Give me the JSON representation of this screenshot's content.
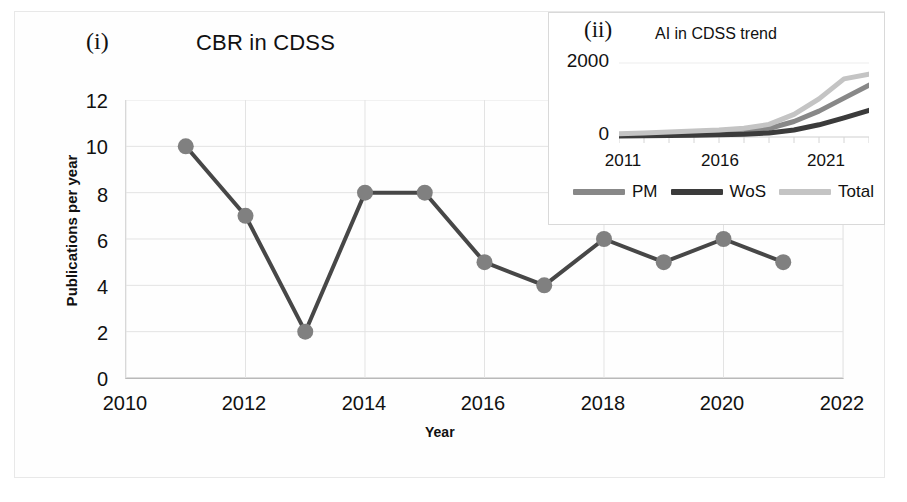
{
  "figure": {
    "panel_tag": "(i)",
    "title": "CBR in CDSS"
  },
  "axes": {
    "y_title": "Publications per year",
    "x_title": "Year",
    "y_ticks": [
      "0",
      "2",
      "4",
      "6",
      "8",
      "10",
      "12"
    ],
    "x_ticks": [
      "2010",
      "2012",
      "2014",
      "2016",
      "2018",
      "2020",
      "2022"
    ]
  },
  "inset": {
    "panel_tag": "(ii)",
    "title": "AI in CDSS trend",
    "y_ticks": [
      "2000",
      "0"
    ],
    "x_ticks": [
      "2011",
      "2016",
      "2021"
    ],
    "legend": [
      {
        "label": "PM",
        "color": "#888888"
      },
      {
        "label": "WoS",
        "color": "#3b3b3b"
      },
      {
        "label": "Total",
        "color": "#c4c4c4"
      }
    ]
  },
  "colors": {
    "line": "#474747",
    "marker": "#808080",
    "grid": "#e3e3e3",
    "axis": "#b9b9b9",
    "pm": "#888888",
    "wos": "#3b3b3b",
    "total": "#c4c4c4"
  },
  "chart_data": {
    "type": "line",
    "title": "CBR in CDSS",
    "xlabel": "Year",
    "ylabel": "Publications per year",
    "xlim": [
      2010,
      2022
    ],
    "ylim": [
      0,
      12
    ],
    "grid": true,
    "legend_position": "none",
    "x": [
      2011,
      2012,
      2013,
      2014,
      2015,
      2016,
      2017,
      2018,
      2019,
      2020,
      2021
    ],
    "values": [
      10,
      7,
      2,
      8,
      8,
      5,
      4,
      6,
      5,
      6,
      5
    ],
    "series": [
      {
        "name": "Publications per year",
        "values": [
          10,
          7,
          2,
          8,
          8,
          5,
          4,
          6,
          5,
          6,
          5
        ]
      }
    ],
    "inset": {
      "type": "line",
      "title": "AI in CDSS trend",
      "xlabel": "",
      "ylabel": "",
      "xlim": [
        2011,
        2021
      ],
      "ylim": [
        0,
        2000
      ],
      "grid": false,
      "legend_position": "bottom",
      "x": [
        2011,
        2012,
        2013,
        2014,
        2015,
        2016,
        2017,
        2018,
        2019,
        2020,
        2021
      ],
      "series": [
        {
          "name": "PM",
          "values": [
            60,
            75,
            90,
            110,
            130,
            160,
            230,
            420,
            700,
            1050,
            1400
          ]
        },
        {
          "name": "WoS",
          "values": [
            30,
            35,
            42,
            50,
            60,
            75,
            110,
            190,
            330,
            520,
            720
          ]
        },
        {
          "name": "Total",
          "values": [
            90,
            110,
            132,
            160,
            190,
            235,
            340,
            610,
            1030,
            1570,
            1700
          ]
        }
      ]
    }
  }
}
